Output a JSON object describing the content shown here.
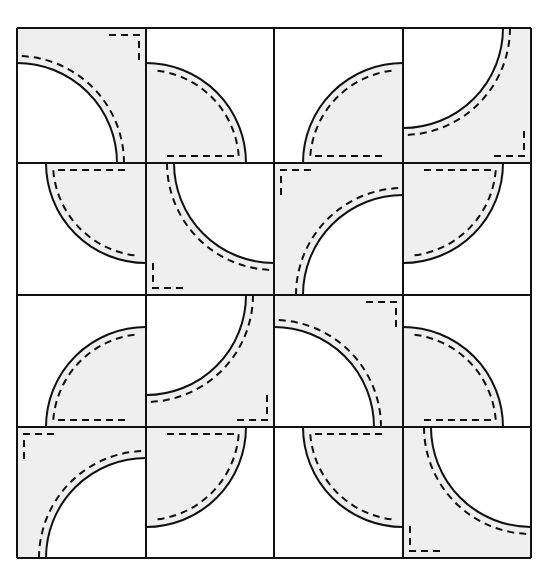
{
  "diagram": {
    "title": "",
    "pattern": "drunkards-path-quilt-block",
    "colors": {
      "fill": "#efefef",
      "background": "#ffffff",
      "line": "#111111"
    },
    "grid": {
      "cols_x": [
        17,
        146,
        274,
        403,
        531
      ],
      "rows_y": [
        28,
        163,
        295,
        427,
        558
      ]
    },
    "radius": 100,
    "seam_offset": 7,
    "cells": [
      {
        "row": 0,
        "col": 0,
        "type": "L",
        "corner": "bl"
      },
      {
        "row": 0,
        "col": 1,
        "type": "pie",
        "corner": "bl"
      },
      {
        "row": 0,
        "col": 2,
        "type": "pie",
        "corner": "br"
      },
      {
        "row": 0,
        "col": 3,
        "type": "L",
        "corner": "tl"
      },
      {
        "row": 1,
        "col": 0,
        "type": "pie",
        "corner": "tr"
      },
      {
        "row": 1,
        "col": 1,
        "type": "L",
        "corner": "tr"
      },
      {
        "row": 1,
        "col": 2,
        "type": "L",
        "corner": "br"
      },
      {
        "row": 1,
        "col": 3,
        "type": "pie",
        "corner": "tl"
      },
      {
        "row": 2,
        "col": 0,
        "type": "pie",
        "corner": "br"
      },
      {
        "row": 2,
        "col": 1,
        "type": "L",
        "corner": "tl"
      },
      {
        "row": 2,
        "col": 2,
        "type": "L",
        "corner": "bl"
      },
      {
        "row": 2,
        "col": 3,
        "type": "pie",
        "corner": "bl"
      },
      {
        "row": 3,
        "col": 0,
        "type": "L",
        "corner": "br"
      },
      {
        "row": 3,
        "col": 1,
        "type": "pie",
        "corner": "tl"
      },
      {
        "row": 3,
        "col": 2,
        "type": "pie",
        "corner": "tr"
      },
      {
        "row": 3,
        "col": 3,
        "type": "L",
        "corner": "tr"
      }
    ]
  }
}
